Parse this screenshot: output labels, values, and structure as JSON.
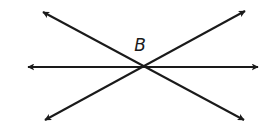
{
  "diagram": {
    "type": "intersecting-lines",
    "stroke_color": "#1a1a1a",
    "background": "#ffffff",
    "intersection": {
      "label": "B",
      "x": 143,
      "y": 67
    },
    "label_position": {
      "x": 140,
      "y": 51
    },
    "lines": [
      {
        "name": "line-horizontal",
        "x1": 28,
        "y1": 67,
        "x2": 258,
        "y2": 67
      },
      {
        "name": "line-descending",
        "x1": 43,
        "y1": 12,
        "x2": 244,
        "y2": 120
      },
      {
        "name": "line-ascending",
        "x1": 45,
        "y1": 120,
        "x2": 245,
        "y2": 11
      }
    ]
  }
}
